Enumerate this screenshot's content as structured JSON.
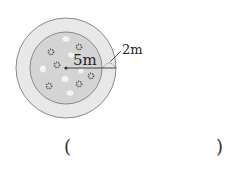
{
  "diagram": {
    "type": "concentric-circles",
    "outer_ring": {
      "label": "2m",
      "fill": "#e6e6e6",
      "stroke": "#8a8a8a"
    },
    "inner_circle": {
      "label": "5m",
      "fill": "#d3d3d3",
      "stroke": "#8a8a8a"
    },
    "decorations": {
      "flowers": 7,
      "stones": 6
    }
  },
  "labels": {
    "inner_radius": "5m",
    "ring_width": "2m"
  },
  "answer": {
    "open": "(",
    "close": ")"
  }
}
